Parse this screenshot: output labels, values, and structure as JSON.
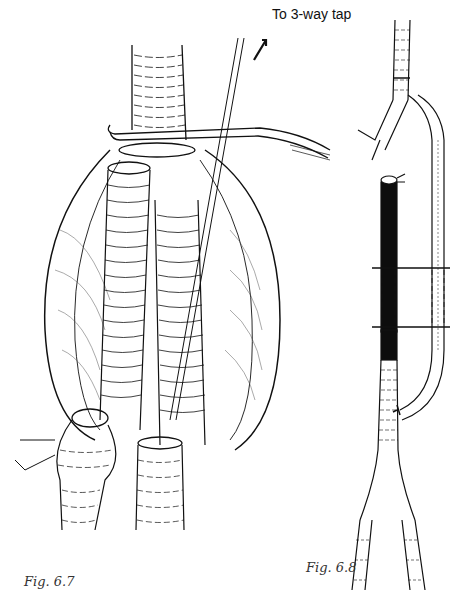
{
  "figures": [
    {
      "id": "fig-6-7",
      "caption": "Fig. 6.7",
      "annotations": [
        {
          "text": "To 3-way tap",
          "arrow": "up-right"
        }
      ]
    },
    {
      "id": "fig-6-8",
      "caption": "Fig. 6.8"
    }
  ],
  "colors": {
    "line": "#111111",
    "background": "#ffffff",
    "graft_fill": "#0d0d0d"
  }
}
